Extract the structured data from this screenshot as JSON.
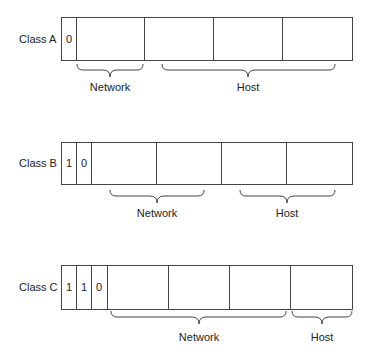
{
  "diagram": {
    "rows": [
      {
        "label": "Class A",
        "bits": [
          "0"
        ],
        "braces": [
          {
            "label": "Network"
          },
          {
            "label": "Host"
          }
        ]
      },
      {
        "label": "Class B",
        "bits": [
          "1",
          "0"
        ],
        "braces": [
          {
            "label": "Network"
          },
          {
            "label": "Host"
          }
        ]
      },
      {
        "label": "Class C",
        "bits": [
          "1",
          "1",
          "0"
        ],
        "braces": [
          {
            "label": "Network"
          },
          {
            "label": "Host"
          }
        ]
      }
    ],
    "colors": {
      "line": "#444444",
      "background": "#ffffff"
    }
  }
}
